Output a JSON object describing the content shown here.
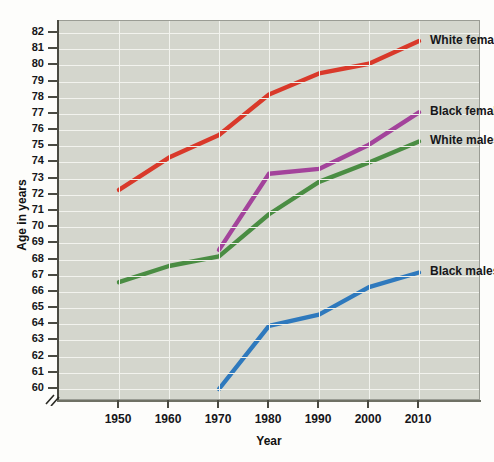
{
  "chart_data": {
    "type": "line",
    "title": "",
    "xlabel": "Year",
    "ylabel": "Age in years",
    "x": [
      1950,
      1960,
      1970,
      1980,
      1990,
      2000,
      2010
    ],
    "xlim": [
      1945,
      2015
    ],
    "ylim": [
      60,
      82
    ],
    "y_axis_break": true,
    "grid": true,
    "legend_position": "right-inline",
    "xticks": [
      "1950",
      "1960",
      "1970",
      "1980",
      "1990",
      "2000",
      "2010"
    ],
    "yticks": [
      "82",
      "81",
      "80",
      "79",
      "78",
      "77",
      "76",
      "75",
      "74",
      "73",
      "72",
      "71",
      "70",
      "69",
      "68",
      "67",
      "66",
      "65",
      "64",
      "63",
      "62",
      "61",
      "60"
    ],
    "series": [
      {
        "name": "White females",
        "color": "#d9392a",
        "x": [
          1950,
          1960,
          1970,
          1980,
          1990,
          2000,
          2010
        ],
        "values": [
          72.3,
          74.3,
          75.7,
          78.2,
          79.5,
          80.1,
          81.5
        ]
      },
      {
        "name": "Black females",
        "color": "#a3439b",
        "x": [
          1970,
          1980,
          1990,
          2000,
          2010
        ],
        "values": [
          68.6,
          73.3,
          73.6,
          75.1,
          77.1
        ]
      },
      {
        "name": "White males",
        "color": "#4a8d43",
        "x": [
          1950,
          1960,
          1970,
          1980,
          1990,
          2000,
          2010
        ],
        "values": [
          66.6,
          67.6,
          68.2,
          70.8,
          72.8,
          74.0,
          75.3
        ]
      },
      {
        "name": "Black males",
        "color": "#2e79bd",
        "x": [
          1970,
          1980,
          1990,
          2000,
          2010
        ],
        "values": [
          60.0,
          63.9,
          64.6,
          66.3,
          67.2
        ]
      }
    ]
  }
}
